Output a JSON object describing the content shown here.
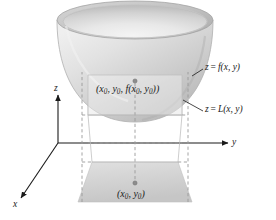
{
  "figure": {
    "axes": {
      "x_label": "x",
      "y_label": "y",
      "z_label": "z"
    },
    "labels": {
      "surface_eq_lhs": "z",
      "surface_eq_rel": "=",
      "surface_eq_rhs": "f(x, y)",
      "surface_eq_full": "z = f(x, y)",
      "plane_eq_full": "z = L(x, y)",
      "point_on_surface": "(x0, y0, f(x0, y0))",
      "point_in_plane": "(x0, y0)",
      "subscript": "0"
    },
    "colors": {
      "surface_light": "#e6e6e6",
      "surface_mid": "#cfcfcf",
      "surface_dark": "#a8a8a8",
      "rim_shadow": "#9e9e9e",
      "base_fill": "#d2d2d2",
      "plane_fill": "#f2f2f2",
      "dashed_stroke": "#9a9a9a",
      "axis_stroke": "#1a1a1a",
      "text": "#1a1a1a",
      "background": "#ffffff"
    },
    "geometry": {
      "bowl_rim_cx": 135,
      "bowl_rim_cy": 20,
      "bowl_rim_rx": 78,
      "bowl_rim_ry": 19,
      "bowl_bottom_y": 122,
      "base_top_y": 162,
      "base_bottom_y": 202,
      "plane_left_x": 88,
      "plane_right_x": 182,
      "plane_top_y": 75,
      "plane_bottom_y": 115,
      "vertical_dash_left_x": 82,
      "vertical_dash_right_x": 188,
      "origin_x": 58,
      "origin_y": 143
    }
  }
}
